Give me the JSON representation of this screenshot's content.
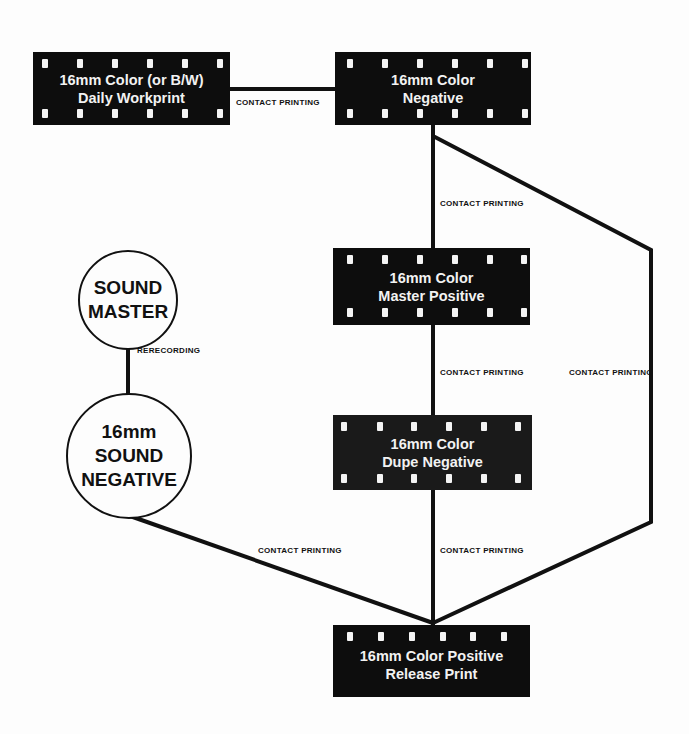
{
  "diagram": {
    "nodes": {
      "workprint": {
        "line1": "16mm Color (or B/W)",
        "line2": "Daily Workprint"
      },
      "negative": {
        "line1": "16mm Color",
        "line2": "Negative"
      },
      "master_positive": {
        "line1": "16mm Color",
        "line2": "Master Positive"
      },
      "dupe_negative": {
        "line1": "16mm Color",
        "line2": "Dupe Negative"
      },
      "release_print": {
        "line1": "16mm Color Positive",
        "line2": "Release Print"
      },
      "sound_master": {
        "line1": "SOUND",
        "line2": "MASTER"
      },
      "sound_negative": {
        "line1": "16mm",
        "line2": "SOUND",
        "line3": "NEGATIVE"
      }
    },
    "edges": {
      "workprint_negative": "CONTACT PRINTING",
      "negative_master": "CONTACT PRINTING",
      "master_dupe": "CONTACT PRINTING",
      "negative_release_direct": "CONTACT PRINTING",
      "sound_rerecording": "RERECORDING",
      "sound_release": "CONTACT PRINTING",
      "dupe_release": "CONTACT PRINTING"
    },
    "colors": {
      "film": "#0d0d0d",
      "line": "#111111",
      "background": "#fdfdfd"
    }
  }
}
